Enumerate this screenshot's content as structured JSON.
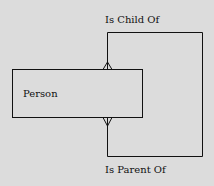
{
  "entity": {
    "name": "Person"
  },
  "relationships": [
    {
      "label": "Is Child Of",
      "position": "top"
    },
    {
      "label": "Is Parent Of",
      "position": "bottom"
    }
  ],
  "colors": {
    "background": "#dcdcdc",
    "line": "#111111"
  }
}
